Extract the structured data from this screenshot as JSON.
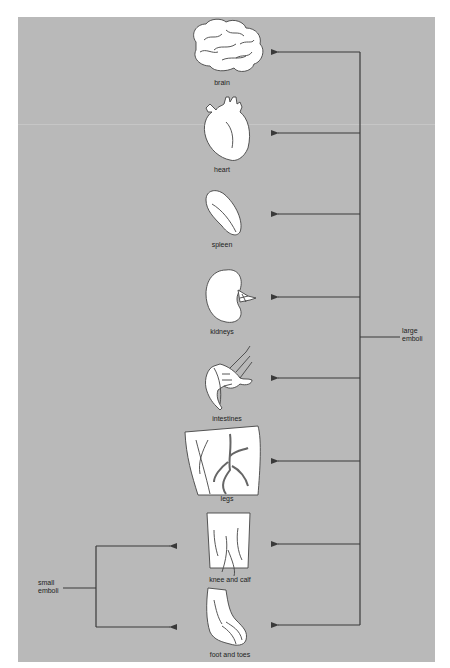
{
  "diagram": {
    "background_color": "#b9b9b9",
    "line_color": "#3a3a3a",
    "organ_fill": "#ffffff",
    "organs": [
      {
        "id": "brain",
        "label": "brain"
      },
      {
        "id": "heart",
        "label": "heart"
      },
      {
        "id": "spleen",
        "label": "spleen"
      },
      {
        "id": "kidneys",
        "label": "kidneys"
      },
      {
        "id": "intestines",
        "label": "intestines"
      },
      {
        "id": "legs",
        "label": "legs"
      },
      {
        "id": "knee-and-calf",
        "label": "knee and calf"
      },
      {
        "id": "foot-and-toes",
        "label": "foot and toes"
      }
    ],
    "large_emboli": {
      "label_line1": "large",
      "label_line2": "emboli",
      "targets": [
        "brain",
        "heart",
        "spleen",
        "kidneys",
        "intestines",
        "legs",
        "knee and calf",
        "foot and toes"
      ]
    },
    "small_emboli": {
      "label_line1": "small",
      "label_line2": "emboli",
      "targets": [
        "knee and calf",
        "foot and toes"
      ]
    }
  }
}
